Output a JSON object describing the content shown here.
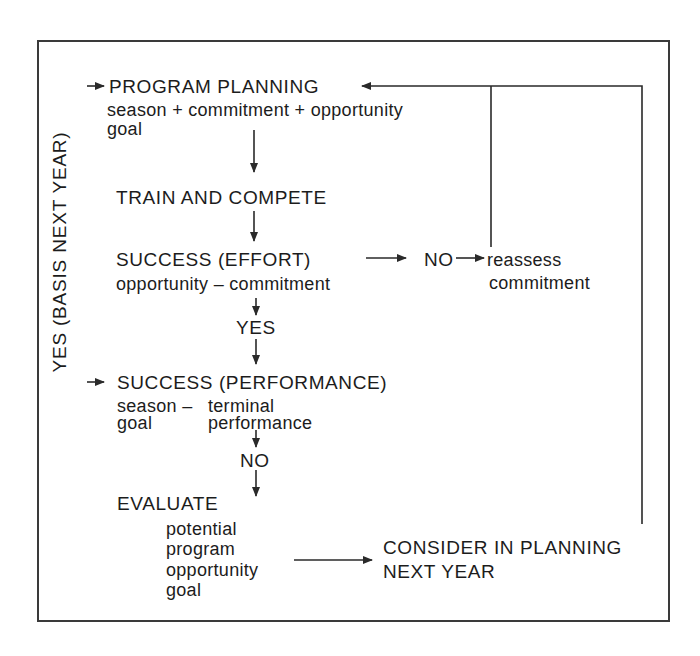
{
  "diagram": {
    "side_label": "YES (BASIS NEXT YEAR)",
    "nodes": {
      "program_planning": {
        "title": "PROGRAM PLANNING",
        "line1": "season + commitment + opportunity",
        "line2": "goal"
      },
      "train_compete": {
        "title": "TRAIN AND COMPETE"
      },
      "success_effort": {
        "title": "SUCCESS (EFFORT)",
        "line1": "opportunity – commitment"
      },
      "decision_yes": {
        "label": "YES"
      },
      "decision_no_effort": {
        "label": "NO"
      },
      "reassess": {
        "line1": "reassess",
        "line2": "commitment"
      },
      "success_performance": {
        "title": "SUCCESS (PERFORMANCE)",
        "line1_left": "season –",
        "line1_right": "terminal",
        "line2_left": "goal",
        "line2_right": "performance"
      },
      "decision_no_performance": {
        "label": "NO"
      },
      "evaluate": {
        "title": "EVALUATE",
        "items": [
          "potential",
          "program",
          "opportunity",
          "goal"
        ]
      },
      "consider": {
        "line1": "CONSIDER IN PLANNING",
        "line2": "NEXT YEAR"
      }
    },
    "colors": {
      "line": "#2a2a2a",
      "text": "#1c1c1c",
      "background": "#ffffff"
    }
  }
}
